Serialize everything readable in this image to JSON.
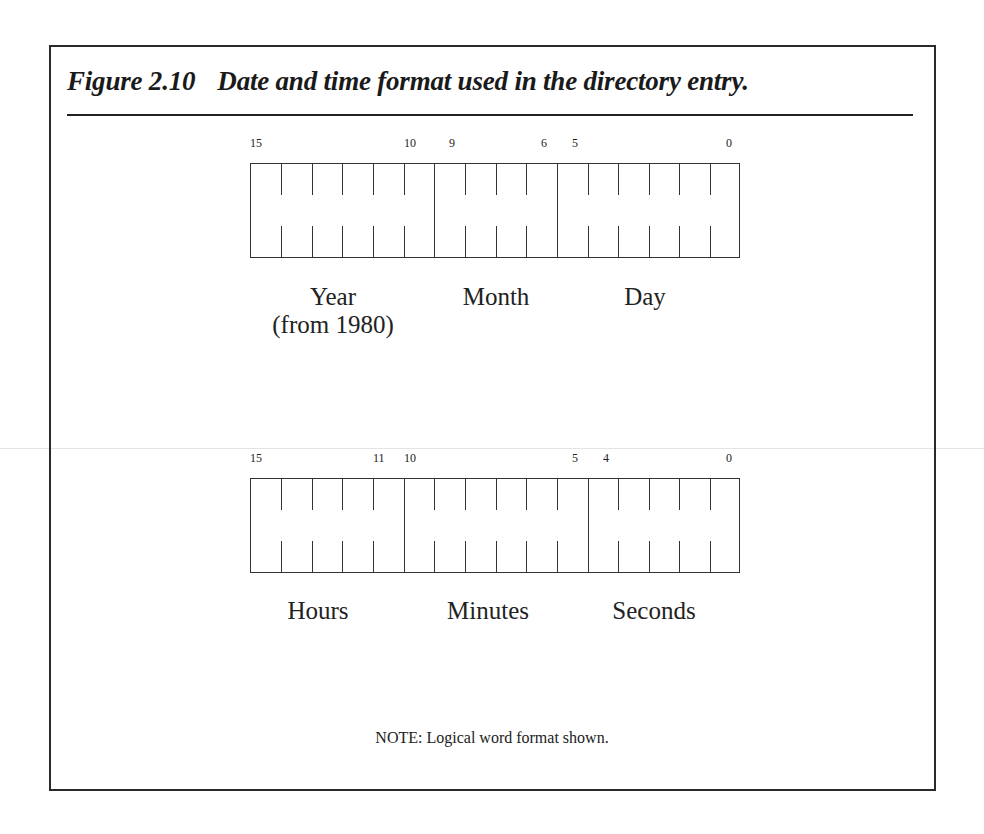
{
  "figure": {
    "number": "Figure 2.10",
    "caption": "Date and time format used in the directory entry.",
    "note": "NOTE: Logical word format shown."
  },
  "date_word": {
    "total_bits": 16,
    "bit_labels": [
      {
        "text": "15",
        "bit": 15
      },
      {
        "text": "10",
        "bit": 10
      },
      {
        "text": "9",
        "bit": 9
      },
      {
        "text": "6",
        "bit": 6
      },
      {
        "text": "5",
        "bit": 5
      },
      {
        "text": "0",
        "bit": 0
      }
    ],
    "fields": [
      {
        "name": "Year",
        "sublabel": "(from 1980)",
        "high_bit": 15,
        "low_bit": 10
      },
      {
        "name": "Month",
        "high_bit": 9,
        "low_bit": 6
      },
      {
        "name": "Day",
        "high_bit": 5,
        "low_bit": 0
      }
    ]
  },
  "time_word": {
    "total_bits": 16,
    "bit_labels": [
      {
        "text": "15",
        "bit": 15
      },
      {
        "text": "11",
        "bit": 11
      },
      {
        "text": "10",
        "bit": 10
      },
      {
        "text": "5",
        "bit": 5
      },
      {
        "text": "4",
        "bit": 4
      },
      {
        "text": "0",
        "bit": 0
      }
    ],
    "fields": [
      {
        "name": "Hours",
        "high_bit": 15,
        "low_bit": 11
      },
      {
        "name": "Minutes",
        "high_bit": 10,
        "low_bit": 5
      },
      {
        "name": "Seconds",
        "high_bit": 4,
        "low_bit": 0
      }
    ]
  },
  "colors": {
    "line": "#333333",
    "text": "#222222",
    "background": "#ffffff"
  }
}
